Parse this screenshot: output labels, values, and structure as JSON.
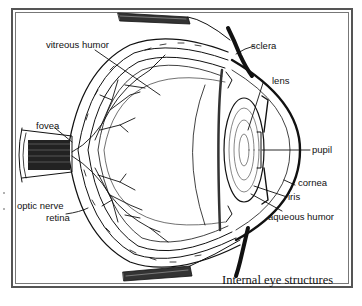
{
  "diagram": {
    "title": "Internal eye structures",
    "labels": {
      "vitreous_humor": "vitreous humor",
      "fovea": "fovea",
      "optic_nerve": "optic nerve",
      "retina": "retina",
      "sclera": "sclera",
      "lens": "lens",
      "pupil": "pupil",
      "cornea": "cornea",
      "iris": "iris",
      "aqueous_humor": "aqueous humor"
    },
    "colors": {
      "ink": "#111111",
      "frame": "#555555",
      "background": "#ffffff"
    }
  }
}
